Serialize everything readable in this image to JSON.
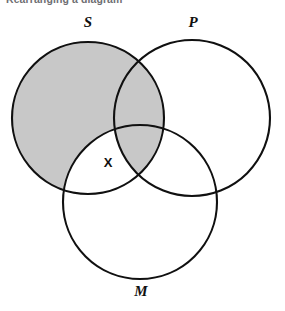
{
  "caption": {
    "text": "Rearranging a diagram"
  },
  "diagram": {
    "type": "venn-3-circle-syllogism",
    "title": "",
    "labels": {
      "s": "S",
      "p": "P",
      "m": "M",
      "x": "X"
    },
    "colors": {
      "shade": "#c8c8c8",
      "stroke": "#101010",
      "background": "#ffffff",
      "text": "#101010",
      "caption_text": "#6e6e72"
    },
    "circles": [
      {
        "id": "S",
        "label": "S",
        "cx": 88,
        "cy": 118,
        "r": 76,
        "label_x": 88,
        "label_y": 27
      },
      {
        "id": "P",
        "label": "P",
        "cx": 192,
        "cy": 118,
        "r": 78,
        "label_x": 193,
        "label_y": 27
      },
      {
        "id": "M",
        "label": "M",
        "cx": 140,
        "cy": 202,
        "r": 77,
        "label_x": 141,
        "label_y": 296
      }
    ],
    "regions": [
      {
        "id": "S-only",
        "description": "S not P not M",
        "shaded": true
      },
      {
        "id": "S-and-P",
        "description": "S and P not M",
        "shaded": true
      },
      {
        "id": "S-and-M",
        "description": "S and M not P",
        "shaded": false,
        "mark": "X"
      },
      {
        "id": "S-P-M",
        "description": "S and P and M",
        "shaded": true
      },
      {
        "id": "P-only",
        "description": "P not S not M",
        "shaded": false
      },
      {
        "id": "P-and-M",
        "description": "P and M not S",
        "shaded": false
      },
      {
        "id": "M-only",
        "description": "M not S not P",
        "shaded": false
      }
    ],
    "marks": [
      {
        "id": "x-mark",
        "label": "X",
        "x": 108,
        "y": 167,
        "region": "S-and-M"
      }
    ]
  }
}
